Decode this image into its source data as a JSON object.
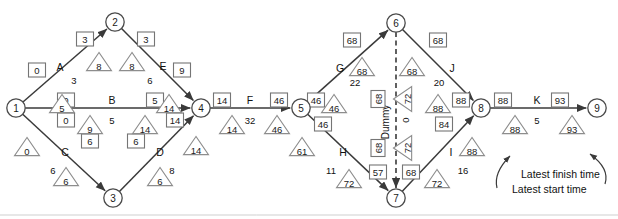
{
  "diagram": {
    "type": "activity-on-arrow-network",
    "nodes": [
      {
        "id": "1",
        "label": "1",
        "x": 16,
        "y": 108
      },
      {
        "id": "2",
        "label": "2",
        "x": 115,
        "y": 22
      },
      {
        "id": "3",
        "label": "3",
        "x": 113,
        "y": 198
      },
      {
        "id": "4",
        "label": "4",
        "x": 201,
        "y": 108
      },
      {
        "id": "5",
        "label": "5",
        "x": 301,
        "y": 108
      },
      {
        "id": "6",
        "label": "6",
        "x": 396,
        "y": 23
      },
      {
        "id": "7",
        "label": "7",
        "x": 396,
        "y": 198
      },
      {
        "id": "8",
        "label": "8",
        "x": 481,
        "y": 108
      },
      {
        "id": "9",
        "label": "9",
        "x": 597,
        "y": 108
      }
    ],
    "activities": [
      {
        "name": "A",
        "duration": "3",
        "from": "1",
        "to": "2",
        "label_x": 60,
        "label_y": 67,
        "dur_x": 74,
        "dur_y": 80
      },
      {
        "name": "E",
        "duration": "6",
        "from": "2",
        "to": "4",
        "label_x": 163,
        "label_y": 66,
        "dur_x": 150,
        "dur_y": 80
      },
      {
        "name": "B",
        "duration": "5",
        "from": "1",
        "to": "4",
        "label_x": 112,
        "label_y": 100,
        "dur_x": 112,
        "dur_y": 120
      },
      {
        "name": "C",
        "duration": "6",
        "from": "1",
        "to": "3",
        "label_x": 65,
        "label_y": 152,
        "dur_x": 53,
        "dur_y": 170
      },
      {
        "name": "D",
        "duration": "8",
        "from": "3",
        "to": "4",
        "label_x": 160,
        "label_y": 152,
        "dur_x": 172,
        "dur_y": 170
      },
      {
        "name": "F",
        "duration": "32",
        "from": "4",
        "to": "5",
        "label_x": 250,
        "label_y": 100,
        "dur_x": 250,
        "dur_y": 120
      },
      {
        "name": "G",
        "duration": "22",
        "from": "5",
        "to": "6",
        "label_x": 340,
        "label_y": 68,
        "dur_x": 355,
        "dur_y": 82
      },
      {
        "name": "H",
        "duration": "11",
        "from": "5",
        "to": "7",
        "label_x": 343,
        "label_y": 152,
        "dur_x": 331,
        "dur_y": 170
      },
      {
        "name": "J",
        "duration": "20",
        "from": "6",
        "to": "8",
        "label_x": 452,
        "label_y": 68,
        "dur_x": 439,
        "dur_y": 82
      },
      {
        "name": "I",
        "duration": "16",
        "from": "7",
        "to": "8",
        "label_x": 451,
        "label_y": 152,
        "dur_x": 463,
        "dur_y": 170
      },
      {
        "name": "K",
        "duration": "5",
        "from": "8",
        "to": "9",
        "label_x": 537,
        "label_y": 100,
        "dur_x": 537,
        "dur_y": 120
      }
    ],
    "dummy": {
      "name": "Dummy",
      "duration": "0",
      "from": "6",
      "to": "7",
      "name_x": 385,
      "name_y": 122,
      "dur_x": 405,
      "dur_y": 120
    },
    "latest_times_boxes": [
      {
        "value": "0",
        "x": 37,
        "y": 70
      },
      {
        "value": "3",
        "x": 85,
        "y": 39
      },
      {
        "value": "3",
        "x": 146,
        "y": 39
      },
      {
        "value": "9",
        "x": 182,
        "y": 70
      },
      {
        "value": "0",
        "x": 66,
        "y": 100
      },
      {
        "value": "5",
        "x": 155,
        "y": 100
      },
      {
        "value": "0",
        "x": 66,
        "y": 120
      },
      {
        "value": "14",
        "x": 175,
        "y": 120
      },
      {
        "value": "6",
        "x": 90,
        "y": 141
      },
      {
        "value": "6",
        "x": 136,
        "y": 141
      },
      {
        "value": "14",
        "x": 222,
        "y": 100
      },
      {
        "value": "46",
        "x": 279,
        "y": 100
      },
      {
        "value": "46",
        "x": 316,
        "y": 100
      },
      {
        "value": "68",
        "x": 352,
        "y": 40
      },
      {
        "value": "68",
        "x": 438,
        "y": 40
      },
      {
        "value": "88",
        "x": 461,
        "y": 100
      },
      {
        "value": "46",
        "x": 323,
        "y": 124
      },
      {
        "value": "84",
        "x": 444,
        "y": 124
      },
      {
        "value": "57",
        "x": 378,
        "y": 172
      },
      {
        "value": "68",
        "x": 411,
        "y": 172
      },
      {
        "value": "68",
        "x": 378,
        "y": 99
      },
      {
        "value": "68",
        "x": 378,
        "y": 148
      },
      {
        "value": "88",
        "x": 503,
        "y": 100
      },
      {
        "value": "93",
        "x": 560,
        "y": 100
      }
    ],
    "earliest_times_triangles": [
      {
        "value": "5",
        "x": 62,
        "y": 105
      },
      {
        "value": "9",
        "x": 90,
        "y": 126
      },
      {
        "value": "0",
        "x": 27,
        "y": 148
      },
      {
        "value": "8",
        "x": 99,
        "y": 63
      },
      {
        "value": "8",
        "x": 132,
        "y": 63
      },
      {
        "value": "14",
        "x": 169,
        "y": 105
      },
      {
        "value": "14",
        "x": 145,
        "y": 126
      },
      {
        "value": "14",
        "x": 196,
        "y": 147
      },
      {
        "value": "6",
        "x": 66,
        "y": 178
      },
      {
        "value": "6",
        "x": 160,
        "y": 178
      },
      {
        "value": "14",
        "x": 232,
        "y": 126
      },
      {
        "value": "46",
        "x": 277,
        "y": 126
      },
      {
        "value": "68",
        "x": 362,
        "y": 68
      },
      {
        "value": "68",
        "x": 412,
        "y": 68
      },
      {
        "value": "46",
        "x": 334,
        "y": 105
      },
      {
        "value": "61",
        "x": 302,
        "y": 148
      },
      {
        "value": "72",
        "x": 349,
        "y": 180
      },
      {
        "value": "72",
        "x": 437,
        "y": 180
      },
      {
        "value": "88",
        "x": 438,
        "y": 105
      },
      {
        "value": "88",
        "x": 472,
        "y": 148
      },
      {
        "value": "88",
        "x": 515,
        "y": 126
      },
      {
        "value": "93",
        "x": 572,
        "y": 126
      }
    ],
    "rotated_triangles": [
      {
        "value": "72",
        "x": 404,
        "y": 99
      },
      {
        "value": "72",
        "x": 404,
        "y": 148
      }
    ],
    "annotations": [
      {
        "text": "Latest finish time",
        "x": 521,
        "y": 174
      },
      {
        "text": "Latest start time",
        "x": 512,
        "y": 189
      }
    ],
    "colors": {
      "line": "#3a3a3a",
      "box_stroke": "#757575",
      "triangle_stroke": "#8d8d8d",
      "node_stroke": "#4a4a4a",
      "text": "#111111",
      "background": "#ffffff"
    }
  }
}
